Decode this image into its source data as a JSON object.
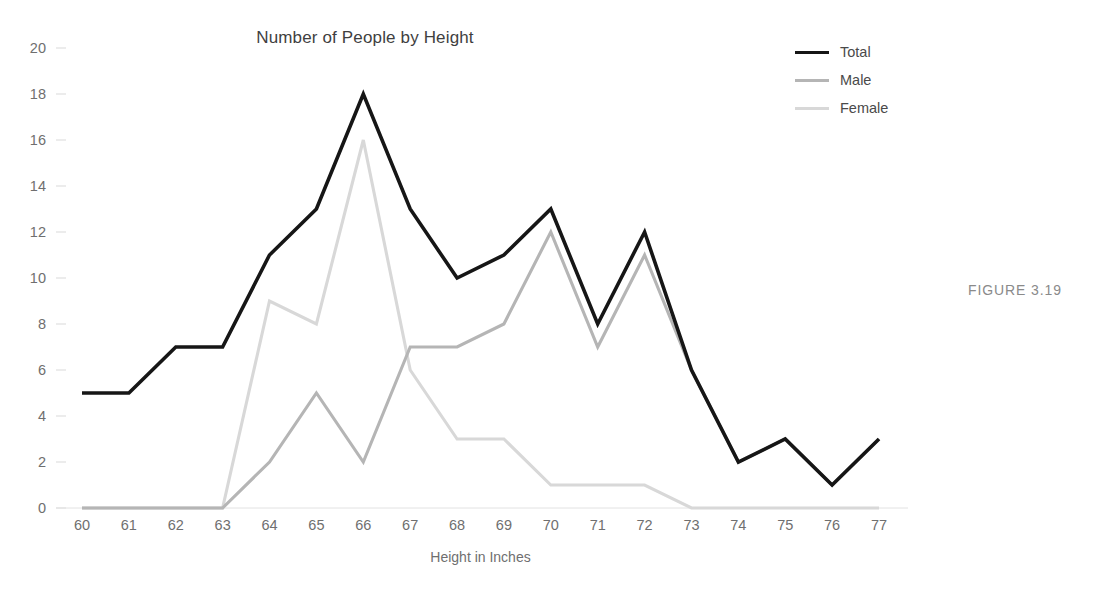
{
  "figure": {
    "caption": "FIGURE 3.19"
  },
  "chart_data": {
    "type": "line",
    "title": "Number of People by Height",
    "xlabel": "Height in Inches",
    "ylabel": "",
    "categories": [
      "60",
      "61",
      "62",
      "63",
      "64",
      "65",
      "66",
      "67",
      "68",
      "69",
      "70",
      "71",
      "72",
      "73",
      "74",
      "75",
      "76",
      "77"
    ],
    "x": [
      60,
      61,
      62,
      63,
      64,
      65,
      66,
      67,
      68,
      69,
      70,
      71,
      72,
      73,
      74,
      75,
      76,
      77
    ],
    "xlim": [
      60,
      77
    ],
    "ylim": [
      0,
      20
    ],
    "yticks": [
      0,
      2,
      4,
      6,
      8,
      10,
      12,
      14,
      16,
      18,
      20
    ],
    "grid": false,
    "legend_position": "top-right",
    "series": [
      {
        "name": "Total",
        "color": "#161616",
        "width": 3.6,
        "values": [
          5,
          5,
          7,
          7,
          11,
          13,
          18,
          13,
          10,
          11,
          13,
          8,
          12,
          6,
          2,
          3,
          1,
          3
        ]
      },
      {
        "name": "Male",
        "color": "#b5b5b5",
        "width": 3.1,
        "values": [
          0,
          0,
          0,
          0,
          2,
          5,
          2,
          7,
          7,
          8,
          12,
          7,
          11,
          6,
          2,
          3,
          1,
          3
        ]
      },
      {
        "name": "Female",
        "color": "#d8d8d8",
        "width": 3.1,
        "values": [
          0,
          0,
          0,
          0,
          9,
          8,
          16,
          6,
          3,
          3,
          1,
          1,
          1,
          0,
          0,
          0,
          0,
          0
        ]
      }
    ]
  },
  "axis": {
    "tick_color": "#d9d9d9",
    "label_color": "#6f6f6f"
  }
}
